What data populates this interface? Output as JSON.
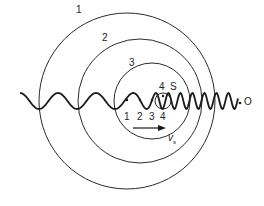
{
  "diagram": {
    "type": "doppler-effect-wavefronts",
    "wavefronts": [
      {
        "label": "1",
        "cx": 127,
        "cy": 101,
        "r": 88
      },
      {
        "label": "2",
        "cx": 140,
        "cy": 101,
        "r": 62
      },
      {
        "label": "3",
        "cx": 152,
        "cy": 101,
        "r": 38
      },
      {
        "label": "4",
        "cx": 163,
        "cy": 101,
        "r": 8
      }
    ],
    "source_positions": [
      "1",
      "2",
      "3",
      "4"
    ],
    "source_label": "S",
    "observer_label": "O",
    "velocity_label": "v",
    "velocity_subscript": "s",
    "colors": {
      "line": "#222222",
      "background": "#ffffff"
    }
  }
}
